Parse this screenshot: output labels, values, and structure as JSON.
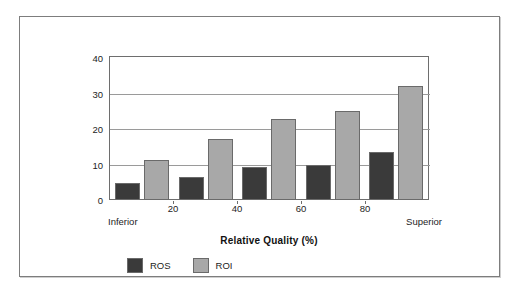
{
  "chart_data": {
    "type": "bar",
    "title": "",
    "xlabel": "Relative Quality (%)",
    "ylabel": "",
    "categories": [
      "10",
      "30",
      "50",
      "70",
      "90"
    ],
    "xtick_labels": [
      "20",
      "40",
      "60",
      "80"
    ],
    "xtick_values": [
      20,
      40,
      60,
      80
    ],
    "x_endpoint_low": "Inferior",
    "x_endpoint_high": "Superior",
    "ylim": [
      0,
      40
    ],
    "ytick_labels": [
      "0",
      "10",
      "20",
      "30",
      "40"
    ],
    "ytick_values": [
      0,
      10,
      20,
      30,
      40
    ],
    "grid": true,
    "grid_axis": "y",
    "legend_position": "bottom-left",
    "series": [
      {
        "name": "ROS",
        "color": "#3a3a3a",
        "values": [
          4.7,
          6.5,
          9.3,
          9.8,
          13.4
        ]
      },
      {
        "name": "ROI",
        "color": "#a8a8a8",
        "values": [
          11.4,
          17.2,
          22.8,
          25.0,
          32.0
        ]
      }
    ]
  },
  "legend": {
    "items": [
      {
        "label": "ROS",
        "color": "#3a3a3a"
      },
      {
        "label": "ROI",
        "color": "#a8a8a8"
      }
    ]
  },
  "colors": {
    "ros": "#3a3a3a",
    "roi": "#a8a8a8",
    "axis": "#6e6e6e",
    "grid": "#9a9a9a",
    "frame": "#7d7d7d",
    "text": "#1d1d1d",
    "background": "#ffffff"
  }
}
